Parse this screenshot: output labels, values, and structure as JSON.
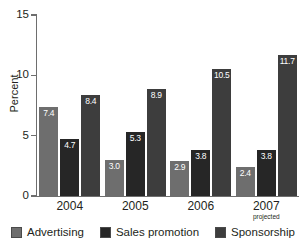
{
  "chart_data": {
    "type": "bar",
    "title": "",
    "subtitle": "",
    "xlabel": "",
    "ylabel": "Percent",
    "ylim": [
      0,
      15
    ],
    "yticks": [
      0,
      5,
      10,
      15
    ],
    "ytick_labels": [
      "0",
      "5",
      "10",
      "15"
    ],
    "grid": false,
    "legend_position": "bottom",
    "categories": [
      "2004",
      "2005",
      "2006",
      "2007"
    ],
    "category_sublabels": [
      "",
      "",
      "",
      "projected"
    ],
    "series": [
      {
        "name": "Advertising",
        "color": "#6e6e6e",
        "values": [
          7.4,
          3.0,
          2.9,
          2.4
        ],
        "labels": [
          "7.4",
          "3.0",
          "2.9",
          "2.4"
        ]
      },
      {
        "name": "Sales promotion",
        "color": "#262626",
        "values": [
          4.7,
          5.3,
          3.8,
          3.8
        ],
        "labels": [
          "4.7",
          "5.3",
          "3.8",
          "3.8"
        ]
      },
      {
        "name": "Sponsorship",
        "color": "#3d3d3d",
        "values": [
          8.4,
          8.9,
          10.5,
          11.7
        ],
        "labels": [
          "8.4",
          "8.9",
          "10.5",
          "11.7"
        ]
      }
    ]
  },
  "axis": {
    "y_title": "Percent",
    "tick_0": "0",
    "tick_5": "5",
    "tick_10": "10",
    "tick_15": "15"
  },
  "categories": {
    "c0": "2004",
    "c1": "2005",
    "c2": "2006",
    "c3": "2007",
    "c3_sub": "projected"
  },
  "legend": {
    "item0": "Advertising",
    "item1": "Sales promotion",
    "item2": "Sponsorship"
  },
  "colors": {
    "advertising": "#6e6e6e",
    "sales_promotion": "#262626",
    "sponsorship": "#3d3d3d",
    "axis": "#6e6e6e",
    "text": "#231f20",
    "background": "#ffffff"
  }
}
